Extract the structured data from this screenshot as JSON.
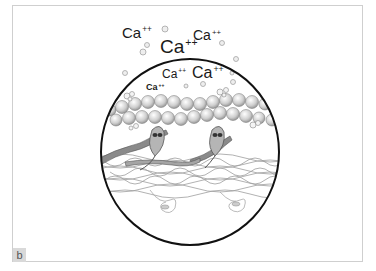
{
  "figure": {
    "panel_label": "b",
    "ion_labels": [
      {
        "text": "Ca",
        "charge": "++",
        "x": 122,
        "y": 25,
        "size": 15,
        "weight": "normal"
      },
      {
        "text": "Ca",
        "charge": "++",
        "x": 193,
        "y": 28,
        "size": 14,
        "weight": "normal"
      },
      {
        "text": "Ca",
        "charge": "++",
        "x": 160,
        "y": 37,
        "size": 19,
        "weight": "normal"
      },
      {
        "text": "Ca",
        "charge": "++",
        "x": 162,
        "y": 68,
        "size": 12,
        "weight": "normal"
      },
      {
        "text": "Ca",
        "charge": "++",
        "x": 192,
        "y": 65,
        "size": 16,
        "weight": "normal"
      },
      {
        "text": "Ca",
        "charge": "++",
        "x": 146,
        "y": 83,
        "size": 9,
        "weight": "bold"
      }
    ],
    "colors": {
      "outline": "#111111",
      "frame": "#cfcfcf",
      "actin_bead": "#bdbdbd",
      "myosin": "#9a9a9a",
      "label_bg": "#d9d9d9"
    }
  }
}
